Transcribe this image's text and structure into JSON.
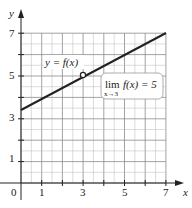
{
  "chart_data": {
    "type": "line",
    "title": "",
    "xlabel": "x",
    "ylabel": "y",
    "xlim": [
      0,
      7
    ],
    "ylim": [
      0,
      7
    ],
    "grid": true,
    "x_ticks": [
      1,
      3,
      5,
      7
    ],
    "y_ticks": [
      1,
      3,
      5,
      7
    ],
    "origin_label": "0",
    "series": [
      {
        "name": "y = f(x)",
        "x": [
          0,
          7
        ],
        "y": [
          3.5,
          7
        ],
        "style": "solid",
        "color": "#222222"
      }
    ],
    "points": [
      {
        "x": 3,
        "y": 5,
        "style": "open-circle",
        "note": "hole at x = 3"
      }
    ],
    "annotations": [
      {
        "text": "y = f(x)",
        "x": 1.6,
        "y": 5.5
      },
      {
        "text": "lim f(x) = 5",
        "subscript": "x→3",
        "box": true,
        "x": 4.7,
        "y": 4.3
      }
    ]
  },
  "labels": {
    "y_axis": "y",
    "x_axis": "x",
    "origin": "0",
    "xt1": "1",
    "xt3": "3",
    "xt5": "5",
    "xt7": "7",
    "yt1": "1",
    "yt3": "3",
    "yt5": "5",
    "yt7": "7",
    "curve_label": "y = f(x)",
    "limit_main": "lim",
    "limit_expr": "f(x) = 5",
    "limit_sub": "x→3"
  },
  "colors": {
    "grid": "#b8b8b8",
    "axis": "#222222",
    "curve": "#222222",
    "box_border": "#999999"
  }
}
